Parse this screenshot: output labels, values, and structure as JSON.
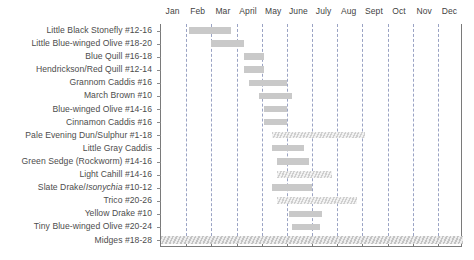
{
  "chart_data": {
    "type": "bar",
    "title": "",
    "subtitle": "",
    "xlabel": "",
    "ylabel": "",
    "orientation": "horizontal",
    "grid": true,
    "legend": "none",
    "x_axis": {
      "ticks": [
        "Jan",
        "Feb",
        "Mar",
        "April",
        "May",
        "June",
        "July",
        "Aug",
        "Sept",
        "Oct",
        "Nov",
        "Dec"
      ],
      "range_months": [
        0,
        12
      ]
    },
    "categories": [
      "Little Black Stonefly #12-16",
      "Little Blue-winged Olive #18-20",
      "Blue Quill #16-18",
      "Hendrickson/Red Quill #12-14",
      "Grannom Caddis #16",
      "March Brown #10",
      "Blue-winged Olive #14-16",
      "Cinnamon Caddis #16",
      "Pale Evening Dun/Sulphur #1-18",
      "Little Gray Caddis",
      "Green Sedge (Rockworm) #14-16",
      "Light Cahill #14-16",
      "Slate Drake/Isonychia #10-12",
      "Trico #20-26",
      "Yellow Drake #10",
      "Tiny Blue-winged Olive #20-24",
      "Midges #18-28"
    ],
    "bars": [
      {
        "label": "Little Black Stonefly #12-16",
        "start_month": 1.1,
        "end_month": 2.8,
        "style": "solid"
      },
      {
        "label": "Little Blue-winged Olive #18-20",
        "start_month": 2.0,
        "end_month": 3.3,
        "style": "solid"
      },
      {
        "label": "Blue Quill #16-18",
        "start_month": 3.3,
        "end_month": 4.1,
        "style": "solid"
      },
      {
        "label": "Hendrickson/Red Quill #12-14",
        "start_month": 3.3,
        "end_month": 4.1,
        "style": "solid"
      },
      {
        "label": "Grannom Caddis #16",
        "start_month": 3.5,
        "end_month": 5.0,
        "style": "solid"
      },
      {
        "label": "March Brown #10",
        "start_month": 3.9,
        "end_month": 5.2,
        "style": "solid"
      },
      {
        "label": "Blue-winged Olive #14-16",
        "start_month": 4.1,
        "end_month": 5.0,
        "style": "solid"
      },
      {
        "label": "Cinnamon Caddis #16",
        "start_month": 4.1,
        "end_month": 5.0,
        "style": "solid"
      },
      {
        "label": "Pale Evening Dun/Sulphur #1-18",
        "start_month": 4.4,
        "end_month": 8.1,
        "style": "hatched"
      },
      {
        "label": "Little Gray Caddis",
        "start_month": 4.4,
        "end_month": 5.7,
        "style": "solid"
      },
      {
        "label": "Green Sedge (Rockworm) #14-16",
        "start_month": 4.6,
        "end_month": 5.9,
        "style": "solid"
      },
      {
        "label": "Light Cahill #14-16",
        "start_month": 4.6,
        "end_month": 6.8,
        "style": "hatched"
      },
      {
        "label": "Slate Drake/Isonychia #10-12",
        "start_month": 4.4,
        "end_month": 6.0,
        "style": "solid"
      },
      {
        "label": "Trico #20-26",
        "start_month": 4.6,
        "end_month": 7.8,
        "style": "hatched"
      },
      {
        "label": "Yellow Drake #10",
        "start_month": 5.1,
        "end_month": 6.4,
        "style": "solid"
      },
      {
        "label": "Tiny Blue-winged Olive #20-24",
        "start_month": 5.2,
        "end_month": 6.3,
        "style": "solid"
      },
      {
        "label": "Midges #18-28",
        "start_month": 0.0,
        "end_month": 12.0,
        "style": "full"
      }
    ]
  }
}
